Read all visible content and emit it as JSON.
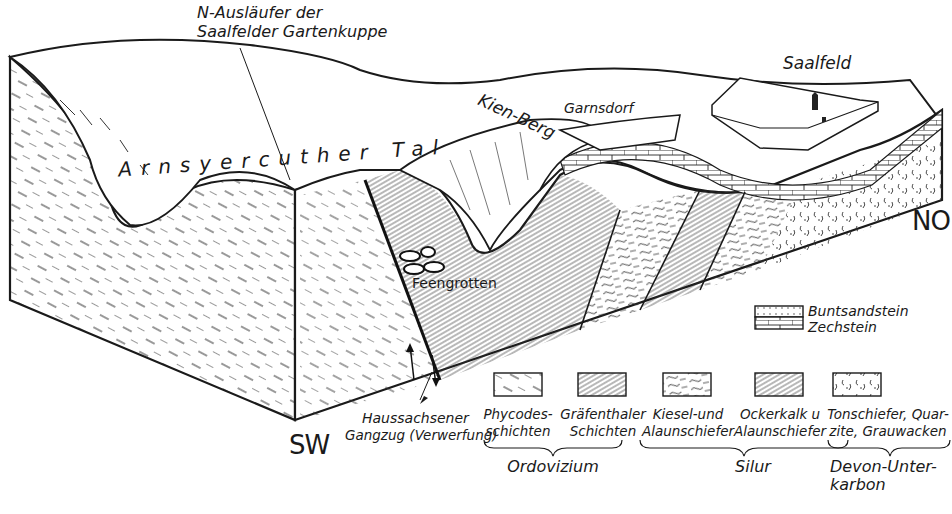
{
  "diagram": {
    "type": "geological block diagram",
    "colors": {
      "ink": "#1a1a1a",
      "background": "#ffffff"
    },
    "labels": {
      "ridge_line1": "N-Ausläufer der",
      "ridge_line2": "Saalfelder Gartenkuppe",
      "valley": "Arnsyercuther Tal",
      "hill": "Kien-Berg",
      "village": "Garnsdorf",
      "town": "Saalfeld",
      "caves": "Feengrotten",
      "fault_line1": "Haussachsener",
      "fault_line2": "Gangzug (Verwerfung)"
    },
    "orientation": {
      "southwest": "SW",
      "northeast": "NO"
    },
    "legend": {
      "top": {
        "line1": "Buntsandstein",
        "line2": "Zechstein"
      },
      "items": [
        {
          "line1": "Phycodes-",
          "line2": "schichten"
        },
        {
          "line1": "Gräfenthaler",
          "line2": "Schichten"
        },
        {
          "line1": "Kiesel-und",
          "line2": "Alaunschiefer"
        },
        {
          "line1": "Ockerkalk u",
          "line2": "Alaunschiefer"
        },
        {
          "line1": "Tonschiefer, Quar-",
          "line2": "zite, Grauwacken"
        }
      ],
      "groups": [
        {
          "line1": "Ordovizium",
          "line2": ""
        },
        {
          "line1": "Silur",
          "line2": ""
        },
        {
          "line1": "Devon-Unter-",
          "line2": "karbon"
        }
      ]
    }
  }
}
